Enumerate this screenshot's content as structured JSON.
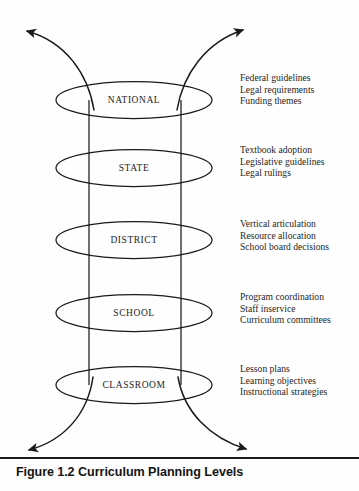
{
  "figure": {
    "caption_number": "Figure 1.2",
    "caption_title": "Curriculum Planning Levels",
    "levels": [
      {
        "name": "NATIONAL",
        "details": [
          "Federal guidelines",
          "Legal requirements",
          "Funding themes"
        ]
      },
      {
        "name": "STATE",
        "details": [
          "Textbook adoption",
          "Legislative guidelines",
          "Legal rulings"
        ]
      },
      {
        "name": "DISTRICT",
        "details": [
          "Vertical articulation",
          "Resource allocation",
          "School board decisions"
        ]
      },
      {
        "name": "SCHOOL",
        "details": [
          "Program coordination",
          "Staff inservice",
          "Curriculum committees"
        ]
      },
      {
        "name": "CLASSROOM",
        "details": [
          "Lesson plans",
          "Learning objectives",
          "Instructional strategies"
        ]
      }
    ],
    "colors": {
      "ink": "#1a1a1a",
      "background": "#fefefe"
    }
  }
}
